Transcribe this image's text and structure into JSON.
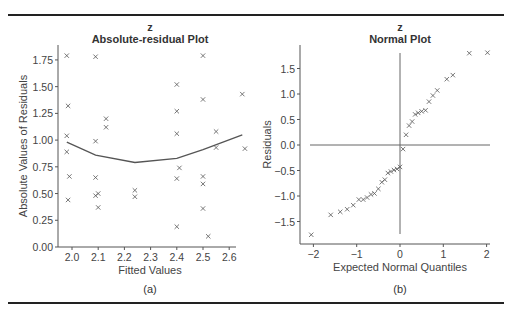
{
  "figure": {
    "captions": [
      "(a)",
      "(b)"
    ]
  },
  "chart_data": [
    {
      "type": "scatter",
      "caption": "(a)",
      "title": "Absolute-residual Plot",
      "supertitle": "z",
      "xlabel": "Fitted Values",
      "ylabel": "Absolute Values of Residuals",
      "xlim": [
        1.96,
        2.66
      ],
      "ylim": [
        0,
        1.85
      ],
      "xticks": [
        2.0,
        2.1,
        2.2,
        2.3,
        2.4,
        2.5,
        2.6
      ],
      "xtick_labels": [
        "2.0",
        "2.1",
        "2.2",
        "2.3",
        "2.4",
        "2.5",
        "2.6"
      ],
      "yticks": [
        0,
        0.25,
        0.5,
        0.75,
        1.0,
        1.25,
        1.5,
        1.75
      ],
      "ytick_labels": [
        "0.00",
        "0.25",
        "0.50",
        "0.75",
        "1.00",
        "1.25",
        "1.50",
        "1.75"
      ],
      "grid": false,
      "marker": "x",
      "points": [
        [
          1.98,
          1.79
        ],
        [
          1.985,
          1.32
        ],
        [
          1.98,
          1.04
        ],
        [
          1.98,
          0.89
        ],
        [
          1.99,
          0.66
        ],
        [
          1.985,
          0.44
        ],
        [
          2.09,
          1.78
        ],
        [
          2.09,
          0.99
        ],
        [
          2.09,
          0.65
        ],
        [
          2.09,
          0.48
        ],
        [
          2.1,
          0.5
        ],
        [
          2.1,
          0.37
        ],
        [
          2.13,
          1.2
        ],
        [
          2.13,
          1.12
        ],
        [
          2.24,
          0.53
        ],
        [
          2.24,
          0.47
        ],
        [
          2.4,
          1.52
        ],
        [
          2.4,
          1.27
        ],
        [
          2.4,
          1.06
        ],
        [
          2.41,
          0.74
        ],
        [
          2.4,
          0.64
        ],
        [
          2.4,
          0.19
        ],
        [
          2.5,
          1.79
        ],
        [
          2.5,
          1.38
        ],
        [
          2.5,
          0.66
        ],
        [
          2.5,
          0.59
        ],
        [
          2.5,
          0.36
        ],
        [
          2.52,
          0.1
        ],
        [
          2.55,
          1.08
        ],
        [
          2.55,
          0.93
        ],
        [
          2.65,
          1.43
        ],
        [
          2.66,
          0.92
        ]
      ],
      "smooth_line": [
        [
          1.98,
          0.98
        ],
        [
          2.09,
          0.86
        ],
        [
          2.24,
          0.79
        ],
        [
          2.4,
          0.83
        ],
        [
          2.5,
          0.91
        ],
        [
          2.65,
          1.05
        ]
      ]
    },
    {
      "type": "scatter",
      "caption": "(b)",
      "title": "Normal Plot",
      "supertitle": "z",
      "xlabel": "Expected Normal Quantiles",
      "ylabel": "Residuals",
      "xlim": [
        -2.25,
        2.2
      ],
      "ylim": [
        -1.95,
        1.95
      ],
      "xticks": [
        -2,
        -1,
        0,
        1,
        2
      ],
      "xtick_labels": [
        "−2",
        "−1",
        "0",
        "1",
        "2"
      ],
      "yticks": [
        -1.5,
        -1.0,
        -0.5,
        0.0,
        0.5,
        1.0,
        1.5
      ],
      "ytick_labels": [
        "−1.5",
        "−1.0",
        "−0.5",
        "0.0",
        "0.5",
        "1.0",
        "1.5"
      ],
      "grid": false,
      "marker": "x",
      "reference_lines": {
        "horizontal_at_y": 0,
        "vertical_at_x": 0
      },
      "points": [
        [
          -2.05,
          -1.76
        ],
        [
          -1.6,
          -1.37
        ],
        [
          -1.38,
          -1.31
        ],
        [
          -1.22,
          -1.26
        ],
        [
          -1.08,
          -1.18
        ],
        [
          -0.95,
          -1.07
        ],
        [
          -0.85,
          -1.07
        ],
        [
          -0.76,
          -1.03
        ],
        [
          -0.67,
          -0.97
        ],
        [
          -0.59,
          -0.95
        ],
        [
          -0.5,
          -0.86
        ],
        [
          -0.42,
          -0.73
        ],
        [
          -0.35,
          -0.68
        ],
        [
          -0.28,
          -0.55
        ],
        [
          -0.21,
          -0.52
        ],
        [
          -0.14,
          -0.49
        ],
        [
          -0.07,
          -0.47
        ],
        [
          0.0,
          -0.43
        ],
        [
          0.07,
          -0.08
        ],
        [
          0.14,
          0.2
        ],
        [
          0.21,
          0.38
        ],
        [
          0.28,
          0.46
        ],
        [
          0.35,
          0.6
        ],
        [
          0.42,
          0.63
        ],
        [
          0.5,
          0.66
        ],
        [
          0.59,
          0.68
        ],
        [
          0.67,
          0.85
        ],
        [
          0.76,
          0.97
        ],
        [
          0.86,
          1.07
        ],
        [
          1.08,
          1.29
        ],
        [
          1.22,
          1.37
        ],
        [
          1.6,
          1.8
        ],
        [
          2.02,
          1.81
        ]
      ]
    }
  ]
}
